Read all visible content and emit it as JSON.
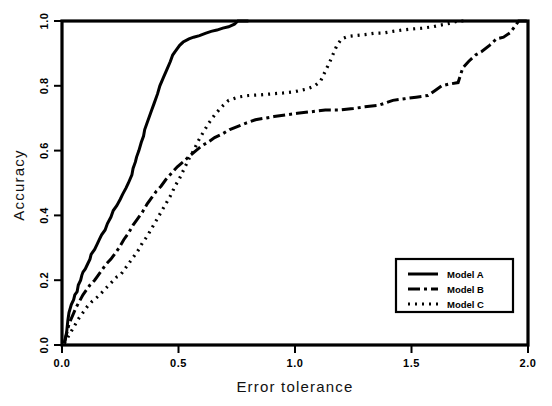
{
  "chart_data": {
    "type": "line",
    "title": "",
    "xlabel": "Error tolerance",
    "ylabel": "Accuracy",
    "xlim": [
      0.0,
      2.0
    ],
    "ylim": [
      0.0,
      1.0
    ],
    "xticks": [
      "0.0",
      "0.5",
      "1.0",
      "1.5",
      "2.0"
    ],
    "xtick_values": [
      0.0,
      0.5,
      1.0,
      1.5,
      2.0
    ],
    "yticks": [
      "0.0",
      "0.2",
      "0.4",
      "0.6",
      "0.8",
      "1.0"
    ],
    "ytick_values": [
      0.0,
      0.2,
      0.4,
      0.6,
      0.8,
      1.0
    ],
    "grid": false,
    "legend_position": "lower right",
    "series": [
      {
        "name": "Model A",
        "style": "solid",
        "dash": "none",
        "width": 3.0,
        "color": "#000000",
        "points": [
          [
            0.01,
            0.005
          ],
          [
            0.02,
            0.04
          ],
          [
            0.025,
            0.075
          ],
          [
            0.03,
            0.1
          ],
          [
            0.04,
            0.125
          ],
          [
            0.05,
            0.14
          ],
          [
            0.055,
            0.155
          ],
          [
            0.065,
            0.165
          ],
          [
            0.07,
            0.185
          ],
          [
            0.08,
            0.2
          ],
          [
            0.085,
            0.215
          ],
          [
            0.09,
            0.225
          ],
          [
            0.1,
            0.235
          ],
          [
            0.11,
            0.25
          ],
          [
            0.12,
            0.265
          ],
          [
            0.125,
            0.28
          ],
          [
            0.14,
            0.295
          ],
          [
            0.15,
            0.31
          ],
          [
            0.16,
            0.325
          ],
          [
            0.17,
            0.34
          ],
          [
            0.185,
            0.355
          ],
          [
            0.195,
            0.375
          ],
          [
            0.21,
            0.395
          ],
          [
            0.22,
            0.415
          ],
          [
            0.235,
            0.43
          ],
          [
            0.25,
            0.45
          ],
          [
            0.26,
            0.465
          ],
          [
            0.275,
            0.485
          ],
          [
            0.285,
            0.5
          ],
          [
            0.3,
            0.525
          ],
          [
            0.305,
            0.545
          ],
          [
            0.315,
            0.565
          ],
          [
            0.32,
            0.58
          ],
          [
            0.33,
            0.6
          ],
          [
            0.34,
            0.625
          ],
          [
            0.35,
            0.645
          ],
          [
            0.355,
            0.665
          ],
          [
            0.365,
            0.685
          ],
          [
            0.375,
            0.705
          ],
          [
            0.385,
            0.725
          ],
          [
            0.395,
            0.745
          ],
          [
            0.41,
            0.775
          ],
          [
            0.42,
            0.8
          ],
          [
            0.435,
            0.825
          ],
          [
            0.45,
            0.85
          ],
          [
            0.465,
            0.875
          ],
          [
            0.475,
            0.895
          ],
          [
            0.49,
            0.91
          ],
          [
            0.505,
            0.925
          ],
          [
            0.52,
            0.935
          ],
          [
            0.545,
            0.945
          ],
          [
            0.565,
            0.95
          ],
          [
            0.59,
            0.955
          ],
          [
            0.615,
            0.962
          ],
          [
            0.64,
            0.968
          ],
          [
            0.665,
            0.972
          ],
          [
            0.69,
            0.978
          ],
          [
            0.715,
            0.982
          ],
          [
            0.74,
            0.99
          ],
          [
            0.755,
            1.0
          ],
          [
            0.8,
            1.0
          ]
        ]
      },
      {
        "name": "Model B",
        "style": "dash-dot",
        "dash": "12,4,3,4",
        "width": 3.0,
        "color": "#000000",
        "points": [
          [
            0.01,
            0.005
          ],
          [
            0.02,
            0.035
          ],
          [
            0.03,
            0.065
          ],
          [
            0.045,
            0.09
          ],
          [
            0.06,
            0.115
          ],
          [
            0.075,
            0.135
          ],
          [
            0.09,
            0.155
          ],
          [
            0.105,
            0.17
          ],
          [
            0.12,
            0.185
          ],
          [
            0.14,
            0.2
          ],
          [
            0.155,
            0.215
          ],
          [
            0.175,
            0.235
          ],
          [
            0.19,
            0.25
          ],
          [
            0.21,
            0.265
          ],
          [
            0.225,
            0.28
          ],
          [
            0.245,
            0.3
          ],
          [
            0.265,
            0.325
          ],
          [
            0.285,
            0.345
          ],
          [
            0.305,
            0.37
          ],
          [
            0.325,
            0.39
          ],
          [
            0.345,
            0.41
          ],
          [
            0.365,
            0.435
          ],
          [
            0.385,
            0.455
          ],
          [
            0.405,
            0.475
          ],
          [
            0.425,
            0.49
          ],
          [
            0.445,
            0.51
          ],
          [
            0.47,
            0.53
          ],
          [
            0.495,
            0.55
          ],
          [
            0.52,
            0.565
          ],
          [
            0.55,
            0.585
          ],
          [
            0.575,
            0.6
          ],
          [
            0.6,
            0.615
          ],
          [
            0.625,
            0.625
          ],
          [
            0.655,
            0.64
          ],
          [
            0.685,
            0.65
          ],
          [
            0.72,
            0.665
          ],
          [
            0.755,
            0.675
          ],
          [
            0.79,
            0.685
          ],
          [
            0.83,
            0.695
          ],
          [
            0.87,
            0.7
          ],
          [
            0.91,
            0.705
          ],
          [
            0.96,
            0.71
          ],
          [
            1.01,
            0.715
          ],
          [
            1.07,
            0.72
          ],
          [
            1.13,
            0.725
          ],
          [
            1.19,
            0.725
          ],
          [
            1.25,
            0.73
          ],
          [
            1.3,
            0.735
          ],
          [
            1.36,
            0.74
          ],
          [
            1.42,
            0.755
          ],
          [
            1.47,
            0.76
          ],
          [
            1.52,
            0.765
          ],
          [
            1.57,
            0.77
          ],
          [
            1.6,
            0.785
          ],
          [
            1.63,
            0.8
          ],
          [
            1.66,
            0.805
          ],
          [
            1.7,
            0.81
          ],
          [
            1.72,
            0.855
          ],
          [
            1.745,
            0.875
          ],
          [
            1.775,
            0.895
          ],
          [
            1.8,
            0.905
          ],
          [
            1.835,
            0.925
          ],
          [
            1.865,
            0.945
          ],
          [
            1.895,
            0.95
          ],
          [
            1.925,
            0.965
          ],
          [
            1.945,
            0.985
          ],
          [
            1.96,
            1.0
          ],
          [
            2.0,
            1.0
          ]
        ]
      },
      {
        "name": "Model C",
        "style": "dotted",
        "dash": "2,5",
        "width": 3.2,
        "color": "#000000",
        "points": [
          [
            0.01,
            0.005
          ],
          [
            0.03,
            0.03
          ],
          [
            0.05,
            0.055
          ],
          [
            0.07,
            0.08
          ],
          [
            0.09,
            0.1
          ],
          [
            0.11,
            0.12
          ],
          [
            0.13,
            0.135
          ],
          [
            0.155,
            0.15
          ],
          [
            0.175,
            0.165
          ],
          [
            0.195,
            0.18
          ],
          [
            0.215,
            0.195
          ],
          [
            0.235,
            0.21
          ],
          [
            0.25,
            0.215
          ],
          [
            0.265,
            0.23
          ],
          [
            0.285,
            0.25
          ],
          [
            0.305,
            0.27
          ],
          [
            0.325,
            0.29
          ],
          [
            0.345,
            0.315
          ],
          [
            0.365,
            0.335
          ],
          [
            0.385,
            0.36
          ],
          [
            0.405,
            0.385
          ],
          [
            0.425,
            0.41
          ],
          [
            0.445,
            0.435
          ],
          [
            0.465,
            0.46
          ],
          [
            0.485,
            0.49
          ],
          [
            0.505,
            0.515
          ],
          [
            0.525,
            0.545
          ],
          [
            0.545,
            0.575
          ],
          [
            0.565,
            0.6
          ],
          [
            0.585,
            0.63
          ],
          [
            0.605,
            0.655
          ],
          [
            0.63,
            0.685
          ],
          [
            0.655,
            0.71
          ],
          [
            0.685,
            0.735
          ],
          [
            0.715,
            0.755
          ],
          [
            0.755,
            0.765
          ],
          [
            0.8,
            0.77
          ],
          [
            0.85,
            0.772
          ],
          [
            0.9,
            0.775
          ],
          [
            0.95,
            0.778
          ],
          [
            1.0,
            0.782
          ],
          [
            1.05,
            0.79
          ],
          [
            1.085,
            0.8
          ],
          [
            1.11,
            0.815
          ],
          [
            1.13,
            0.845
          ],
          [
            1.15,
            0.875
          ],
          [
            1.165,
            0.9
          ],
          [
            1.18,
            0.925
          ],
          [
            1.2,
            0.945
          ],
          [
            1.225,
            0.952
          ],
          [
            1.26,
            0.955
          ],
          [
            1.3,
            0.958
          ],
          [
            1.34,
            0.962
          ],
          [
            1.38,
            0.963
          ],
          [
            1.42,
            0.968
          ],
          [
            1.46,
            0.972
          ],
          [
            1.5,
            0.975
          ],
          [
            1.545,
            0.978
          ],
          [
            1.59,
            0.982
          ],
          [
            1.63,
            0.988
          ],
          [
            1.665,
            0.993
          ],
          [
            1.7,
            1.0
          ],
          [
            1.73,
            1.0
          ]
        ]
      }
    ]
  },
  "legend": {
    "entries": [
      {
        "label": "Model A"
      },
      {
        "label": "Model B"
      },
      {
        "label": "Model C"
      }
    ]
  }
}
